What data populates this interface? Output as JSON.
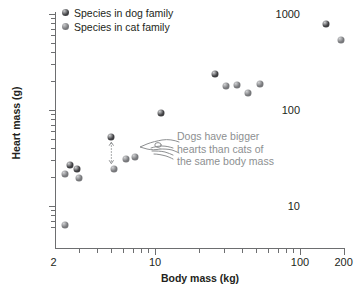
{
  "chart_data": {
    "type": "scatter",
    "title": "",
    "xlabel": "Body mass (kg)",
    "ylabel": "Heart mass (g)",
    "xscale": "log",
    "yscale": "log",
    "xlim": [
      2,
      220
    ],
    "ylim": [
      5,
      1100
    ],
    "grid": false,
    "legend_position": "top-left",
    "xticks_major": [
      2,
      10,
      100,
      200
    ],
    "xticks_major_labels": [
      "2",
      "10",
      "100",
      "200"
    ],
    "yticks_major": [
      10,
      100,
      1000
    ],
    "yticks_major_labels": [
      "10",
      "100",
      "1000"
    ],
    "series": [
      {
        "name": "Species in dog family",
        "color": "#3f3f42",
        "points": [
          {
            "x": 2.6,
            "y": 26.5
          },
          {
            "x": 2.9,
            "y": 24.0
          },
          {
            "x": 5.0,
            "y": 52.0
          },
          {
            "x": 11.0,
            "y": 92.0
          },
          {
            "x": 26.0,
            "y": 235.0
          },
          {
            "x": 150.0,
            "y": 790.0
          }
        ]
      },
      {
        "name": "Species in cat family",
        "color": "#77787b",
        "points": [
          {
            "x": 2.4,
            "y": 6.3
          },
          {
            "x": 2.4,
            "y": 21.5
          },
          {
            "x": 3.0,
            "y": 19.5
          },
          {
            "x": 5.2,
            "y": 24.5
          },
          {
            "x": 6.3,
            "y": 31.0
          },
          {
            "x": 7.3,
            "y": 32.5
          },
          {
            "x": 31.0,
            "y": 178.0
          },
          {
            "x": 37.0,
            "y": 180.0
          },
          {
            "x": 44.0,
            "y": 152.0
          },
          {
            "x": 53.0,
            "y": 186.0
          },
          {
            "x": 193.0,
            "y": 540.0
          }
        ]
      }
    ],
    "annotation": {
      "lines": [
        "Dogs have bigger",
        "hearts than cats of",
        "the same body mass"
      ],
      "color": "#8d8f91",
      "icon": "pointing-hand-icon",
      "arrow": {
        "type": "double-headed-dotted",
        "x": 5.0,
        "y_from": 24.5,
        "y_to": 52.0
      }
    }
  },
  "axes": {
    "y_title": "Heart mass (g)",
    "x_title": "Body mass (kg)"
  },
  "legend": {
    "items": [
      {
        "label": "Species in dog family",
        "color": "#3f3f42",
        "marker": "dog-family-marker"
      },
      {
        "label": "Species in cat family",
        "color": "#77787b",
        "marker": "cat-family-marker"
      }
    ]
  }
}
